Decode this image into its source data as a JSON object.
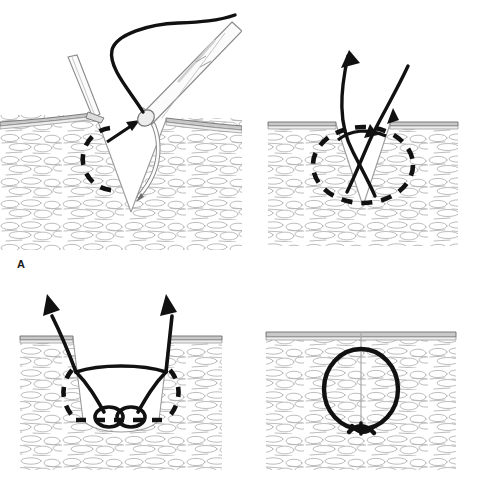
{
  "figure": {
    "panel_count": 4,
    "background_color": "#ffffff"
  },
  "colors": {
    "suture_black": "#111111",
    "needle_outline": "#555555",
    "instrument_fill": "#fbfbfb",
    "instrument_outline": "#8a8a8a",
    "epidermis_fill": "#c9c9c9",
    "epidermis_line": "#6e6e6e",
    "dermis_fill": "#ffffff",
    "dermis_cell_line": "#b4b4b4",
    "wound_edge_line": "#9a9a9a",
    "label_color": "#1a1a1a"
  },
  "panels": [
    {
      "id": "a",
      "label": "A",
      "caption": "Needle holder drives curved needle into the dermis at the wound edge; forceps evert the skin edge. Dashed circle shows the intended circular needle path.",
      "elements": [
        "forceps",
        "needle-holder",
        "curved-needle",
        "suture-thread",
        "dashed-path-circle",
        "direction-arrow",
        "epidermis-layer",
        "dermis-tissue",
        "v-shaped-wound"
      ]
    },
    {
      "id": "b",
      "label": "B",
      "caption": "Suture passes through both wound edges from deep to superficial, exiting at the opposite side. Arrows indicate thread direction.",
      "elements": [
        "suture-thread",
        "entry-arrow",
        "exit-arrow",
        "direction-arrow",
        "dashed-path-circle",
        "epidermis-layer",
        "dermis-tissue",
        "v-shaped-wound"
      ]
    },
    {
      "id": "c",
      "label": "C",
      "caption": "Both suture ends are drawn up out of the wound; the loop lies buried at the base of the wound with the knot forming below.",
      "elements": [
        "suture-loops",
        "left-tail-arrow",
        "right-tail-arrow",
        "dashed-path-circle",
        "epidermis-layer",
        "dermis-tissue",
        "wide-wound-cavity"
      ]
    },
    {
      "id": "d",
      "label": "D",
      "caption": "Completed buried dermal suture: the knot is inverted deep in the wound and the wound edges are approximated.",
      "elements": [
        "completed-suture-loop",
        "buried-knot",
        "closed-wound-line",
        "epidermis-layer",
        "dermis-tissue"
      ]
    }
  ]
}
